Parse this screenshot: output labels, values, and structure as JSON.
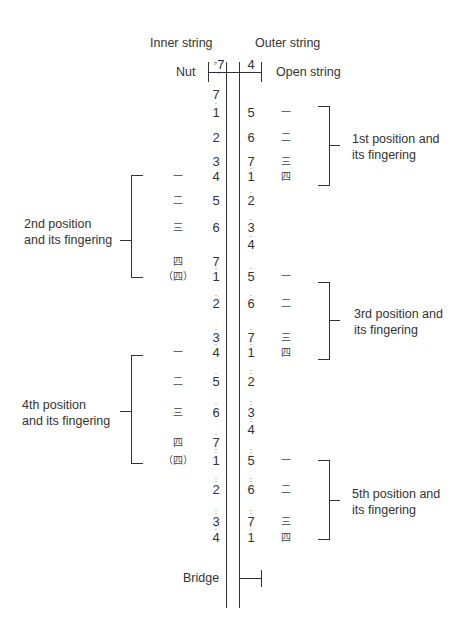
{
  "headers": {
    "inner_string": "Inner string",
    "outer_string": "Outer string",
    "nut": "Nut",
    "open_string": "Open string",
    "bridge": "Bridge"
  },
  "open_notes": {
    "inner": {
      "flat": "♭",
      "digit": "7",
      "dots_below": 1
    },
    "outer": {
      "digit": "4",
      "dots_below": 0
    }
  },
  "positions": [
    {
      "label_line1": "1st position and",
      "label_line2": "its fingering",
      "side": "right"
    },
    {
      "label_line1": "2nd position",
      "label_line2": "and its fingering",
      "side": "left"
    },
    {
      "label_line1": "3rd position and",
      "label_line2": "its fingering",
      "side": "right"
    },
    {
      "label_line1": "4th position",
      "label_line2": "and its fingering",
      "side": "left"
    },
    {
      "label_line1": "5th position and",
      "label_line2": "its fingering",
      "side": "right"
    }
  ],
  "fingers": {
    "one": "一",
    "two": "二",
    "three": "三",
    "four": "四",
    "four_paren": "（四）"
  },
  "inner_notes": [
    {
      "y": 95,
      "digit": "7",
      "above": 0,
      "below": 1
    },
    {
      "y": 113,
      "digit": "1",
      "above": 0,
      "below": 0
    },
    {
      "y": 138,
      "digit": "2",
      "above": 0,
      "below": 0
    },
    {
      "y": 162,
      "digit": "3",
      "above": 0,
      "below": 0
    },
    {
      "y": 177,
      "digit": "4",
      "above": 0,
      "below": 0
    },
    {
      "y": 201,
      "digit": "5",
      "above": 0,
      "below": 0
    },
    {
      "y": 228,
      "digit": "6",
      "above": 0,
      "below": 0
    },
    {
      "y": 262,
      "digit": "7",
      "above": 0,
      "below": 0
    },
    {
      "y": 277,
      "digit": "1",
      "above": 1,
      "below": 0
    },
    {
      "y": 304,
      "digit": "2",
      "above": 1,
      "below": 0
    },
    {
      "y": 338,
      "digit": "3",
      "above": 1,
      "below": 0
    },
    {
      "y": 353,
      "digit": "4",
      "above": 1,
      "below": 0
    },
    {
      "y": 382,
      "digit": "5",
      "above": 1,
      "below": 0
    },
    {
      "y": 413,
      "digit": "6",
      "above": 1,
      "below": 0
    },
    {
      "y": 443,
      "digit": "7",
      "above": 1,
      "below": 0
    },
    {
      "y": 461,
      "digit": "1",
      "above": 2,
      "below": 0
    },
    {
      "y": 490,
      "digit": "2",
      "above": 2,
      "below": 0
    },
    {
      "y": 522,
      "digit": "3",
      "above": 2,
      "below": 0
    },
    {
      "y": 538,
      "digit": "4",
      "above": 2,
      "below": 0
    }
  ],
  "outer_notes": [
    {
      "y": 113,
      "digit": "5",
      "above": 0,
      "below": 0
    },
    {
      "y": 138,
      "digit": "6",
      "above": 0,
      "below": 0
    },
    {
      "y": 162,
      "digit": "7",
      "above": 0,
      "below": 0
    },
    {
      "y": 177,
      "digit": "1",
      "above": 1,
      "below": 0
    },
    {
      "y": 201,
      "digit": "2",
      "above": 1,
      "below": 0
    },
    {
      "y": 228,
      "digit": "3",
      "above": 1,
      "below": 0
    },
    {
      "y": 245,
      "digit": "4",
      "above": 1,
      "below": 0
    },
    {
      "y": 277,
      "digit": "5",
      "above": 1,
      "below": 0
    },
    {
      "y": 304,
      "digit": "6",
      "above": 1,
      "below": 0
    },
    {
      "y": 338,
      "digit": "7",
      "above": 1,
      "below": 0
    },
    {
      "y": 353,
      "digit": "1",
      "above": 2,
      "below": 0
    },
    {
      "y": 382,
      "digit": "2",
      "above": 2,
      "below": 0
    },
    {
      "y": 413,
      "digit": "3",
      "above": 2,
      "below": 0
    },
    {
      "y": 430,
      "digit": "4",
      "above": 2,
      "below": 0
    },
    {
      "y": 461,
      "digit": "5",
      "above": 2,
      "below": 0
    },
    {
      "y": 490,
      "digit": "6",
      "above": 2,
      "below": 0
    },
    {
      "y": 522,
      "digit": "7",
      "above": 2,
      "below": 0
    },
    {
      "y": 538,
      "digit": "1",
      "above": 3,
      "below": 0
    }
  ],
  "right_fingerings": [
    {
      "y": 113,
      "finger": "一"
    },
    {
      "y": 138,
      "finger": "二"
    },
    {
      "y": 162,
      "finger": "三"
    },
    {
      "y": 177,
      "finger": "四"
    },
    {
      "y": 277,
      "finger": "一"
    },
    {
      "y": 304,
      "finger": "二"
    },
    {
      "y": 338,
      "finger": "三"
    },
    {
      "y": 353,
      "finger": "四"
    },
    {
      "y": 461,
      "finger": "一"
    },
    {
      "y": 490,
      "finger": "二"
    },
    {
      "y": 522,
      "finger": "三"
    },
    {
      "y": 538,
      "finger": "四"
    }
  ],
  "left_fingerings": [
    {
      "y": 177,
      "finger": "一"
    },
    {
      "y": 201,
      "finger": "二"
    },
    {
      "y": 228,
      "finger": "三"
    },
    {
      "y": 262,
      "finger": "四"
    },
    {
      "y": 277,
      "finger": "（四）"
    },
    {
      "y": 353,
      "finger": "一"
    },
    {
      "y": 382,
      "finger": "二"
    },
    {
      "y": 413,
      "finger": "三"
    },
    {
      "y": 443,
      "finger": "四"
    },
    {
      "y": 461,
      "finger": "（四）"
    }
  ]
}
